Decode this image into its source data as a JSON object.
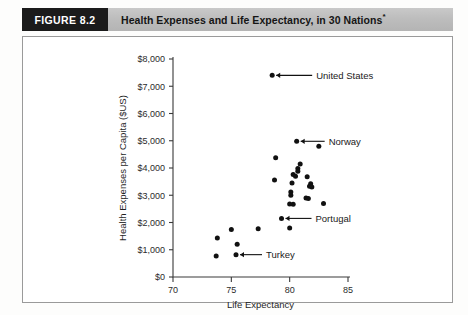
{
  "header": {
    "figure_tag": "FIGURE 8.2",
    "title": "Health Expenses and Life Expectancy, in 30 Nations",
    "title_footnote_marker": "*"
  },
  "chart_data": {
    "type": "scatter",
    "title": "Health Expenses and Life Expectancy, in 30 Nations",
    "xlabel": "Life Expectancy",
    "ylabel": "Health Expenses per Capita ($US)",
    "xlim": [
      70,
      85
    ],
    "ylim": [
      0,
      8000
    ],
    "xticks": [
      70,
      75,
      80,
      85
    ],
    "xtick_labels": [
      "70",
      "75",
      "80",
      "85"
    ],
    "yticks": [
      0,
      1000,
      2000,
      3000,
      4000,
      5000,
      6000,
      7000,
      8000
    ],
    "ytick_labels": [
      "$0",
      "$1,000",
      "$2,000",
      "$3,000",
      "$4,000",
      "$5,000",
      "$6,000",
      "$7,000",
      "$8,000"
    ],
    "grid": false,
    "legend": "none",
    "marker": "filled-circle",
    "marker_color": "#111111",
    "points": [
      {
        "x": 78.5,
        "y": 7400,
        "label": "United States"
      },
      {
        "x": 80.6,
        "y": 4980,
        "label": "Norway"
      },
      {
        "x": 82.5,
        "y": 4800,
        "label": ""
      },
      {
        "x": 78.8,
        "y": 4380,
        "label": ""
      },
      {
        "x": 80.9,
        "y": 4150,
        "label": ""
      },
      {
        "x": 80.7,
        "y": 3980,
        "label": ""
      },
      {
        "x": 80.7,
        "y": 3880,
        "label": ""
      },
      {
        "x": 80.3,
        "y": 3760,
        "label": ""
      },
      {
        "x": 80.5,
        "y": 3700,
        "label": ""
      },
      {
        "x": 81.5,
        "y": 3680,
        "label": ""
      },
      {
        "x": 78.7,
        "y": 3560,
        "label": ""
      },
      {
        "x": 81.8,
        "y": 3420,
        "label": ""
      },
      {
        "x": 81.7,
        "y": 3330,
        "label": ""
      },
      {
        "x": 81.9,
        "y": 3300,
        "label": ""
      },
      {
        "x": 80.1,
        "y": 3120,
        "label": ""
      },
      {
        "x": 80.1,
        "y": 3000,
        "label": ""
      },
      {
        "x": 81.4,
        "y": 2900,
        "label": ""
      },
      {
        "x": 81.6,
        "y": 2880,
        "label": ""
      },
      {
        "x": 80.0,
        "y": 2680,
        "label": ""
      },
      {
        "x": 80.3,
        "y": 2670,
        "label": ""
      },
      {
        "x": 82.9,
        "y": 2700,
        "label": ""
      },
      {
        "x": 79.3,
        "y": 2150,
        "label": "Portugal"
      },
      {
        "x": 80.0,
        "y": 1800,
        "label": ""
      },
      {
        "x": 77.3,
        "y": 1770,
        "label": ""
      },
      {
        "x": 75.0,
        "y": 1740,
        "label": ""
      },
      {
        "x": 73.8,
        "y": 1430,
        "label": ""
      },
      {
        "x": 75.5,
        "y": 1200,
        "label": ""
      },
      {
        "x": 75.4,
        "y": 820,
        "label": "Turkey"
      },
      {
        "x": 73.7,
        "y": 770,
        "label": ""
      },
      {
        "x": 80.2,
        "y": 3450,
        "label": ""
      }
    ],
    "annotations": [
      {
        "text": "United States",
        "point_x": 78.5,
        "point_y": 7400
      },
      {
        "text": "Norway",
        "point_x": 80.6,
        "point_y": 4980
      },
      {
        "text": "Portugal",
        "point_x": 79.3,
        "point_y": 2150
      },
      {
        "text": "Turkey",
        "point_x": 75.4,
        "point_y": 820
      }
    ]
  }
}
